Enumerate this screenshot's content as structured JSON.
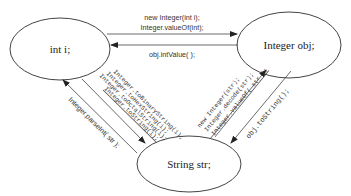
{
  "nodes": {
    "int": {
      "label": "int i;"
    },
    "integer": {
      "label": "Integer obj;"
    },
    "string": {
      "label": "String str;"
    }
  },
  "edges": {
    "int_to_integer": {
      "lines": [
        "new Integer(int i);",
        "Integer.valueOf(int);"
      ]
    },
    "integer_to_int": {
      "lines": [
        "obj.intValue( );"
      ]
    },
    "int_to_string": {
      "lines": [
        "Integer.toBinaryString(i);",
        "Integer.toHexString(i);",
        "Integer.toOctalString(i);",
        "Integer.toString(i);"
      ]
    },
    "string_to_int": {
      "lines": [
        "Integer.parseInt( str );"
      ]
    },
    "string_to_integer": {
      "lines": [
        "new Integer(str);",
        "Integer.decode(str);",
        "Integer.valueOf( str );"
      ]
    },
    "integer_to_string": {
      "lines": [
        "obj.toString();"
      ]
    }
  },
  "colors": {
    "stroke": "#444444",
    "text": "#333333",
    "background": "#ffffff"
  }
}
